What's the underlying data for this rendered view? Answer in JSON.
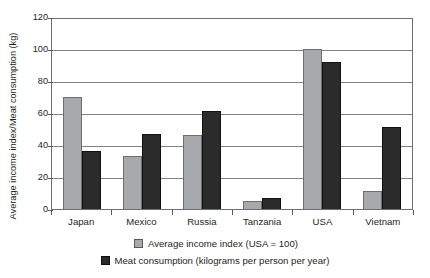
{
  "chart_data": {
    "type": "bar",
    "title": "",
    "subtitle": "",
    "xlabel": "",
    "ylabel": "Average income index/Meat consumption (kg)",
    "ylim": [
      0,
      120
    ],
    "yticks": [
      0,
      20,
      40,
      60,
      80,
      100,
      120
    ],
    "ytick_labels": [
      "0",
      "20",
      "40",
      "60",
      "80",
      "100",
      "120"
    ],
    "grid": true,
    "legend_position": "bottom",
    "categories": [
      "Japan",
      "Mexico",
      "Russia",
      "Tanzania",
      "USA",
      "Vietnam"
    ],
    "series": [
      {
        "name": "Average income index (USA = 100)",
        "color": "#a7a9ac",
        "values": [
          70,
          33,
          46,
          5,
          100,
          11
        ]
      },
      {
        "name": "Meat consumption (kilograms per person per year)",
        "color": "#2b2b2b",
        "values": [
          36,
          47,
          61,
          7,
          92,
          51
        ]
      }
    ]
  },
  "legend": {
    "items": [
      {
        "label": "Average income index (USA = 100)"
      },
      {
        "label": "Meat consumption (kilograms per person per year)"
      }
    ]
  },
  "colors": {
    "series_0": "#a7a9ac",
    "series_1": "#2b2b2b",
    "gridline": "#808285",
    "frame": "#6d6e71",
    "text": "#231f20",
    "background": "#ffffff"
  }
}
